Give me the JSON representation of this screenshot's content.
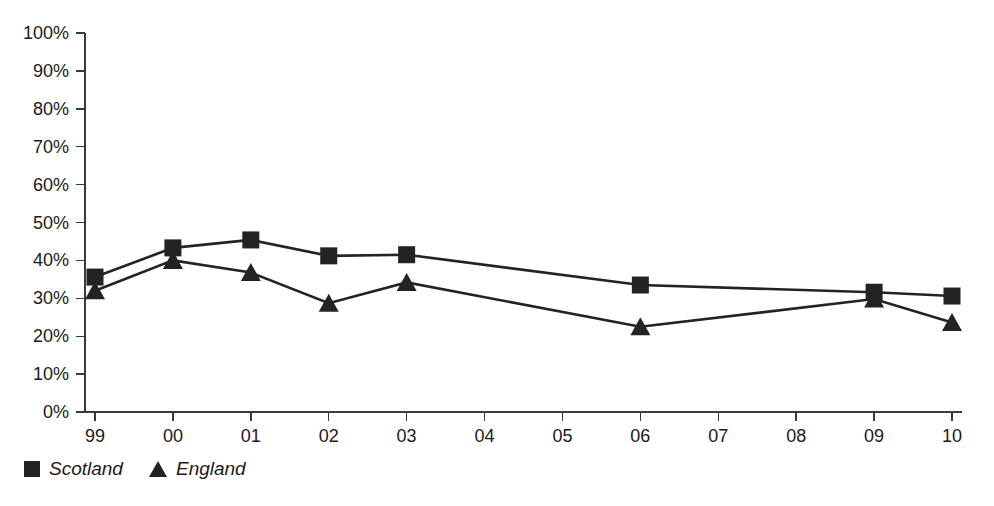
{
  "chart_data": {
    "type": "line",
    "title": "",
    "subtitle": "",
    "xlabel": "",
    "ylabel": "",
    "categories": [
      "99",
      "00",
      "01",
      "02",
      "03",
      "04",
      "05",
      "06",
      "07",
      "08",
      "09",
      "10"
    ],
    "ylim": [
      0,
      100
    ],
    "yticks": [
      0,
      10,
      20,
      30,
      40,
      50,
      60,
      70,
      80,
      90,
      100
    ],
    "ytick_labels": [
      "0%",
      "10%",
      "20%",
      "30%",
      "40%",
      "50%",
      "60%",
      "70%",
      "80%",
      "90%",
      "100%"
    ],
    "xtick_labels": [
      "99",
      "00",
      "01",
      "02",
      "03",
      "04",
      "05",
      "06",
      "07",
      "08",
      "09",
      "10"
    ],
    "grid": false,
    "legend_position": "bottom-left",
    "series": [
      {
        "name": "Scotland",
        "marker": "square",
        "color": "#232323",
        "values": [
          35.6,
          43.3,
          45.4,
          41.2,
          41.5,
          null,
          null,
          33.5,
          null,
          null,
          31.6,
          30.6
        ]
      },
      {
        "name": "England",
        "marker": "triangle",
        "color": "#232323",
        "values": [
          32.0,
          40.0,
          36.8,
          28.7,
          34.2,
          null,
          null,
          22.5,
          null,
          null,
          29.8,
          23.6
        ]
      }
    ],
    "annotations": []
  },
  "legend": {
    "entries": [
      {
        "label": "Scotland",
        "marker": "square-marker-icon"
      },
      {
        "label": "England",
        "marker": "triangle-marker-icon"
      }
    ]
  },
  "colors": {
    "ink": "#232323",
    "axis": "#3a3a3a",
    "background": "#ffffff"
  }
}
